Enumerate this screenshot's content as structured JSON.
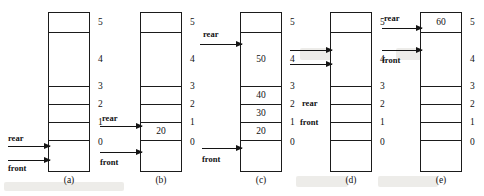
{
  "figure": {
    "capacity": 6,
    "indices": [
      "5",
      "4",
      "3",
      "2",
      "1",
      "0"
    ],
    "pointer_names": {
      "rear": "rear",
      "front": "front"
    },
    "panels": [
      {
        "caption": "(a)",
        "cells": [
          {
            "index": "5",
            "value": ""
          },
          {
            "index": "4",
            "value": ""
          },
          {
            "index": "3",
            "value": ""
          },
          {
            "index": "2",
            "value": ""
          },
          {
            "index": "1",
            "value": ""
          },
          {
            "index": "0",
            "value": ""
          }
        ],
        "pointers": [
          {
            "name": "rear",
            "label": "rear",
            "target_index": "0",
            "style": "arrow"
          },
          {
            "name": "front",
            "label": "front",
            "target_index": "0",
            "style": "arrow"
          }
        ]
      },
      {
        "caption": "(b)",
        "cells": [
          {
            "index": "5",
            "value": ""
          },
          {
            "index": "4",
            "value": ""
          },
          {
            "index": "3",
            "value": ""
          },
          {
            "index": "2",
            "value": ""
          },
          {
            "index": "1",
            "value": "20"
          },
          {
            "index": "0",
            "value": ""
          }
        ],
        "pointers": [
          {
            "name": "rear",
            "label": "rear",
            "target_index": "1",
            "style": "arrow"
          },
          {
            "name": "front",
            "label": "front",
            "target_index": "0",
            "style": "arrow"
          }
        ]
      },
      {
        "caption": "(c)",
        "cells": [
          {
            "index": "5",
            "value": ""
          },
          {
            "index": "4",
            "value": "50"
          },
          {
            "index": "3",
            "value": "40"
          },
          {
            "index": "2",
            "value": "30"
          },
          {
            "index": "1",
            "value": "20"
          },
          {
            "index": "0",
            "value": ""
          }
        ],
        "pointers": [
          {
            "name": "rear",
            "label": "rear",
            "target_index": "4",
            "style": "arrow"
          },
          {
            "name": "front",
            "label": "front",
            "target_index": "0",
            "style": "arrow"
          }
        ]
      },
      {
        "caption": "(d)",
        "cells": [
          {
            "index": "5",
            "value": ""
          },
          {
            "index": "4",
            "value": ""
          },
          {
            "index": "3",
            "value": ""
          },
          {
            "index": "2",
            "value": ""
          },
          {
            "index": "1",
            "value": ""
          },
          {
            "index": "0",
            "value": ""
          }
        ],
        "pointers": [
          {
            "name": "rear",
            "label": "rear",
            "target_index": "2",
            "style": "text"
          },
          {
            "name": "front",
            "label": "front",
            "target_index": "1",
            "style": "text"
          }
        ]
      },
      {
        "caption": "(e)",
        "cells": [
          {
            "index": "5",
            "value": "60"
          },
          {
            "index": "4",
            "value": ""
          },
          {
            "index": "3",
            "value": ""
          },
          {
            "index": "2",
            "value": ""
          },
          {
            "index": "1",
            "value": ""
          },
          {
            "index": "0",
            "value": ""
          }
        ],
        "pointers": [
          {
            "name": "rear",
            "label": "rear",
            "target_index": "5",
            "style": "arrow"
          },
          {
            "name": "front",
            "label": "front",
            "target_index": "4",
            "style": "arrow"
          }
        ]
      }
    ],
    "inter_panel_arrows": [
      {
        "from_caption": "(c)",
        "to_caption": "(d)",
        "count": 2
      }
    ],
    "colors": {
      "ink": "#1b1b1b",
      "paper": "#ffffff"
    }
  }
}
